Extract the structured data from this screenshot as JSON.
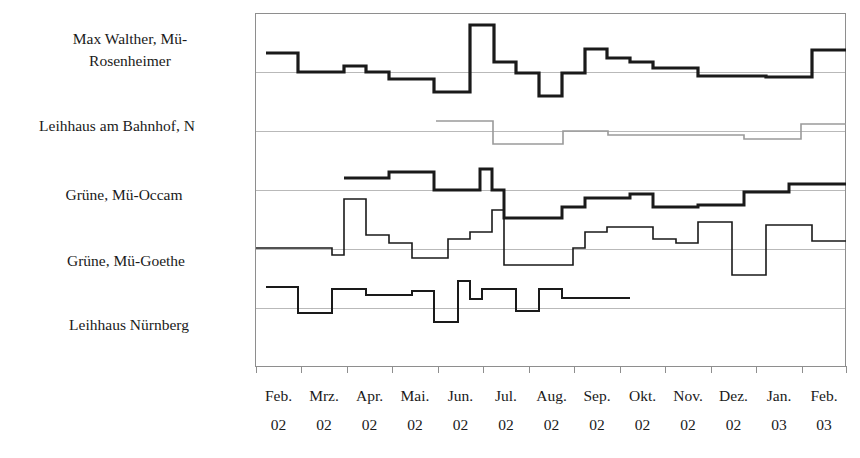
{
  "chart_data": {
    "type": "line",
    "title": "",
    "subtitle": "",
    "xlabel": "",
    "ylabel": "",
    "grid": true,
    "legend_position": "left-inline-labels",
    "step_style": "step-post",
    "x_tick_labels": [
      {
        "month": "Feb.",
        "year": "02"
      },
      {
        "month": "Mrz.",
        "year": "02"
      },
      {
        "month": "Apr.",
        "year": "02"
      },
      {
        "month": "Mai.",
        "year": "02"
      },
      {
        "month": "Jun.",
        "year": "02"
      },
      {
        "month": "Jul.",
        "year": "02"
      },
      {
        "month": "Aug.",
        "year": "02"
      },
      {
        "month": "Sep.",
        "year": "02"
      },
      {
        "month": "Okt.",
        "year": "02"
      },
      {
        "month": "Nov.",
        "year": "02"
      },
      {
        "month": "Dez.",
        "year": "02"
      },
      {
        "month": "Jan.",
        "year": "03"
      },
      {
        "month": "Feb.",
        "year": "03"
      }
    ],
    "x": [
      "Feb. 02",
      "Mrz. 02",
      "Apr. 02",
      "Mai. 02",
      "Jun. 02",
      "Jul. 02",
      "Aug. 02",
      "Sep. 02",
      "Okt. 02",
      "Nov. 02",
      "Dez. 02",
      "Jan. 03",
      "Feb. 03"
    ],
    "ylim": [
      0,
      100
    ],
    "y_gridline_values": [
      16,
      32,
      48,
      64,
      80,
      96
    ],
    "series": [
      {
        "name": "Max Walther, Mü-Rosenheimer",
        "color": "#1a1a1a",
        "width": 3.2,
        "label_x_px": 130,
        "label_y_px": 44,
        "points_px": [
          [
            266,
            53
          ],
          [
            298,
            53
          ],
          [
            298,
            72
          ],
          [
            344,
            72
          ],
          [
            344,
            66
          ],
          [
            366,
            66
          ],
          [
            366,
            72
          ],
          [
            389,
            72
          ],
          [
            389,
            79
          ],
          [
            434,
            79
          ],
          [
            434,
            92
          ],
          [
            470,
            92
          ],
          [
            470,
            25
          ],
          [
            494,
            25
          ],
          [
            494,
            62
          ],
          [
            516,
            62
          ],
          [
            516,
            73
          ],
          [
            539,
            73
          ],
          [
            539,
            96
          ],
          [
            562,
            96
          ],
          [
            562,
            73
          ],
          [
            585,
            73
          ],
          [
            585,
            49
          ],
          [
            607,
            49
          ],
          [
            607,
            58
          ],
          [
            630,
            58
          ],
          [
            630,
            62
          ],
          [
            653,
            62
          ],
          [
            653,
            68
          ],
          [
            698,
            68
          ],
          [
            698,
            76
          ],
          [
            766,
            76
          ],
          [
            766,
            77
          ],
          [
            812,
            77
          ],
          [
            812,
            50
          ],
          [
            846,
            50
          ]
        ]
      },
      {
        "name": "Leihhaus am Bahnhof, N",
        "color": "#9a9a9a",
        "width": 1.6,
        "label_x_px": 112,
        "label_y_px": 129,
        "points_px": [
          [
            436,
            121
          ],
          [
            493,
            121
          ],
          [
            493,
            144
          ],
          [
            563,
            144
          ],
          [
            563,
            131
          ],
          [
            608,
            131
          ],
          [
            608,
            135
          ],
          [
            744,
            135
          ],
          [
            744,
            139
          ],
          [
            801,
            139
          ],
          [
            801,
            124
          ],
          [
            846,
            124
          ]
        ]
      },
      {
        "name": "Grüne, Mü-Occam",
        "color": "#1a1a1a",
        "width": 3.0,
        "label_x_px": 124,
        "label_y_px": 197,
        "points_px": [
          [
            344,
            178
          ],
          [
            389,
            178
          ],
          [
            389,
            172
          ],
          [
            434,
            172
          ],
          [
            434,
            190
          ],
          [
            480,
            190
          ],
          [
            480,
            169
          ],
          [
            492,
            169
          ],
          [
            492,
            190
          ],
          [
            504,
            190
          ],
          [
            504,
            218
          ],
          [
            562,
            218
          ],
          [
            562,
            207
          ],
          [
            585,
            207
          ],
          [
            585,
            198
          ],
          [
            630,
            198
          ],
          [
            630,
            194
          ],
          [
            653,
            194
          ],
          [
            653,
            207
          ],
          [
            698,
            207
          ],
          [
            698,
            205
          ],
          [
            744,
            205
          ],
          [
            744,
            192
          ],
          [
            789,
            192
          ],
          [
            789,
            184
          ],
          [
            846,
            184
          ]
        ]
      },
      {
        "name": "Grüne, Mü-Goethe",
        "color": "#1a1a1a",
        "width": 1.6,
        "label_x_px": 128,
        "label_y_px": 261,
        "points_px": [
          [
            256,
            248
          ],
          [
            332,
            248
          ],
          [
            332,
            255
          ],
          [
            344,
            255
          ],
          [
            344,
            199
          ],
          [
            366,
            199
          ],
          [
            366,
            235
          ],
          [
            389,
            235
          ],
          [
            389,
            243
          ],
          [
            412,
            243
          ],
          [
            412,
            258
          ],
          [
            434,
            258
          ],
          [
            434,
            258
          ],
          [
            448,
            258
          ],
          [
            448,
            239
          ],
          [
            470,
            239
          ],
          [
            470,
            232
          ],
          [
            480,
            232
          ],
          [
            480,
            232
          ],
          [
            492,
            232
          ],
          [
            492,
            210
          ],
          [
            504,
            210
          ],
          [
            504,
            265
          ],
          [
            562,
            265
          ],
          [
            562,
            265
          ],
          [
            573,
            265
          ],
          [
            573,
            248
          ],
          [
            585,
            248
          ],
          [
            585,
            232
          ],
          [
            607,
            232
          ],
          [
            607,
            227
          ],
          [
            630,
            227
          ],
          [
            630,
            227
          ],
          [
            653,
            227
          ],
          [
            653,
            239
          ],
          [
            676,
            239
          ],
          [
            676,
            243
          ],
          [
            698,
            243
          ],
          [
            698,
            222
          ],
          [
            721,
            222
          ],
          [
            721,
            222
          ],
          [
            732,
            222
          ],
          [
            732,
            275
          ],
          [
            766,
            275
          ],
          [
            766,
            225
          ],
          [
            812,
            225
          ],
          [
            812,
            241
          ],
          [
            846,
            241
          ]
        ]
      },
      {
        "name": "Leihhaus Nürnberg",
        "color": "#1a1a1a",
        "width": 2.0,
        "label_x_px": 128,
        "label_y_px": 325,
        "points_px": [
          [
            266,
            287
          ],
          [
            298,
            287
          ],
          [
            298,
            313
          ],
          [
            332,
            313
          ],
          [
            332,
            289
          ],
          [
            366,
            289
          ],
          [
            366,
            295
          ],
          [
            412,
            295
          ],
          [
            412,
            291
          ],
          [
            434,
            291
          ],
          [
            434,
            322
          ],
          [
            458,
            322
          ],
          [
            458,
            281
          ],
          [
            470,
            281
          ],
          [
            470,
            299
          ],
          [
            482,
            299
          ],
          [
            482,
            289
          ],
          [
            516,
            289
          ],
          [
            516,
            311
          ],
          [
            539,
            311
          ],
          [
            539,
            289
          ],
          [
            562,
            289
          ],
          [
            562,
            298
          ],
          [
            630,
            298
          ]
        ]
      }
    ],
    "plot_area_px": {
      "x": 255,
      "y": 13,
      "width": 591,
      "height": 353
    },
    "gridlines_px": [
      72,
      131,
      190,
      249,
      308
    ],
    "xtick_px": [
      256,
      301,
      347,
      392,
      438,
      483,
      529,
      574,
      620,
      665,
      711,
      756,
      802,
      846
    ]
  },
  "series_labels": {
    "max_walther_line1": "Max Walther, Mü-",
    "max_walther_line2": "Rosenheimer",
    "leihhaus_bahnhof": "Leihhaus am Bahnhof, N",
    "gruene_occam": "Grüne, Mü-Occam",
    "gruene_goethe": "Grüne, Mü-Goethe",
    "leihhaus_nuernberg": "Leihhaus Nürnberg"
  },
  "colors": {
    "ink": "#1a1a1a",
    "gray_series": "#9a9a9a",
    "gridline": "#b9b9b9",
    "axis": "#8e8e8e",
    "background": "#ffffff"
  }
}
